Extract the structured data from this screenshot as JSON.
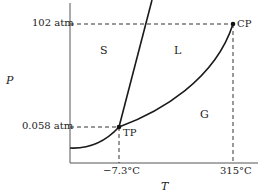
{
  "diagram": {
    "type": "phase-diagram",
    "axes": {
      "x_label": "T",
      "y_label": "P"
    },
    "y_ticks": [
      {
        "label": "102 atm"
      },
      {
        "label": "0.058 atm"
      }
    ],
    "x_ticks": [
      {
        "label": "−7.3°C"
      },
      {
        "label": "315°C"
      }
    ],
    "regions": [
      {
        "label": "S"
      },
      {
        "label": "L"
      },
      {
        "label": "G"
      }
    ],
    "points": [
      {
        "label": "TP",
        "name": "triple point"
      },
      {
        "label": "CP",
        "name": "critical point"
      }
    ],
    "colors": {
      "line": "#1a1a1a",
      "dashed": "#333333",
      "background": "#ffffff"
    }
  }
}
